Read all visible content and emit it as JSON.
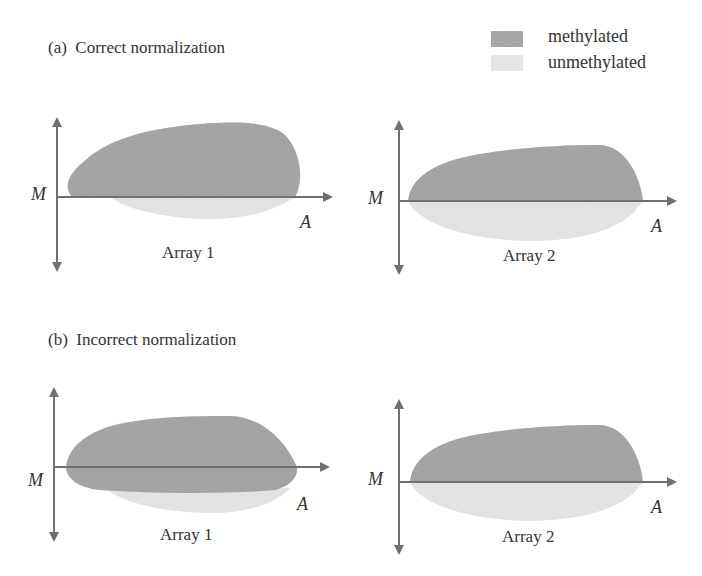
{
  "legend": {
    "items": [
      {
        "label": "methylated",
        "color": "#9a9a9a"
      },
      {
        "label": "unmethylated",
        "color": "#dedede"
      }
    ]
  },
  "panels": [
    {
      "title": "(a)  Correct normalization",
      "arrays": [
        {
          "label": "Array 1",
          "y_axis_label": "M",
          "x_axis_label": "A"
        },
        {
          "label": "Array 2",
          "y_axis_label": "M",
          "x_axis_label": "A"
        }
      ]
    },
    {
      "title": "(b)  Incorrect normalization",
      "arrays": [
        {
          "label": "Array 1",
          "y_axis_label": "M",
          "x_axis_label": "A"
        },
        {
          "label": "Array 2",
          "y_axis_label": "M",
          "x_axis_label": "A"
        }
      ]
    }
  ],
  "colors": {
    "axis": "#707070",
    "methylated": "#9a9a9a",
    "unmethylated": "#dedede"
  }
}
